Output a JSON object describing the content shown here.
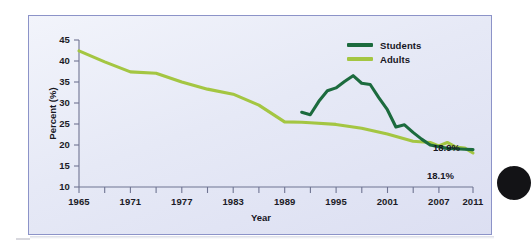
{
  "chart_data": {
    "type": "line",
    "title": "",
    "xlabel": "Year",
    "ylabel": "Percent (%)",
    "xlim": [
      1965,
      2011
    ],
    "ylim": [
      10,
      45
    ],
    "ytick_labels": [
      "45",
      "40",
      "35",
      "30",
      "25",
      "20",
      "15",
      "10"
    ],
    "ytick_values": [
      45,
      40,
      35,
      30,
      25,
      20,
      15,
      10
    ],
    "xtick_labels": [
      "1965",
      "1971",
      "1977",
      "1983",
      "1989",
      "1995",
      "2001",
      "2007",
      "2011"
    ],
    "xtick_values": [
      1965,
      1971,
      1977,
      1983,
      1989,
      1995,
      2001,
      2007,
      2011
    ],
    "minor_xticks": [
      1968,
      1974,
      1980,
      1986,
      1992,
      1998,
      2004,
      2010
    ],
    "grid": false,
    "legend_position": "top-right",
    "series": [
      {
        "name": "Students",
        "color": "#1c6b3e",
        "x": [
          1991,
          1992,
          1993,
          1994,
          1995,
          1996,
          1997,
          1998,
          1999,
          2000,
          2001,
          2002,
          2003,
          2004,
          2005,
          2006,
          2007,
          2008,
          2009,
          2010,
          2011
        ],
        "values": [
          27.8,
          27.2,
          30.4,
          32.9,
          33.6,
          35.1,
          36.5,
          34.7,
          34.4,
          31.3,
          28.4,
          24.3,
          24.8,
          23.0,
          21.4,
          20.0,
          19.6,
          19.2,
          19.1,
          19.0,
          18.9
        ]
      },
      {
        "name": "Adults",
        "color": "#a4c642",
        "x": [
          1965,
          1968,
          1971,
          1974,
          1977,
          1980,
          1983,
          1986,
          1989,
          1991,
          1992,
          1995,
          1998,
          2001,
          2004,
          2006,
          2007,
          2008,
          2009,
          2010,
          2011
        ],
        "values": [
          42.4,
          39.8,
          37.4,
          37.1,
          35.0,
          33.3,
          32.1,
          29.5,
          25.5,
          25.4,
          25.3,
          24.9,
          24.0,
          22.6,
          20.9,
          20.6,
          19.8,
          20.6,
          19.5,
          19.3,
          18.1
        ]
      }
    ],
    "annotations": [
      {
        "text": "18.9%",
        "series": "Students",
        "value": 18.9
      },
      {
        "text": "18.1%",
        "series": "Adults",
        "value": 18.1
      }
    ],
    "legend": [
      {
        "label": "Students",
        "color": "#1c6b3e"
      },
      {
        "label": "Adults",
        "color": "#a4c642"
      }
    ]
  }
}
